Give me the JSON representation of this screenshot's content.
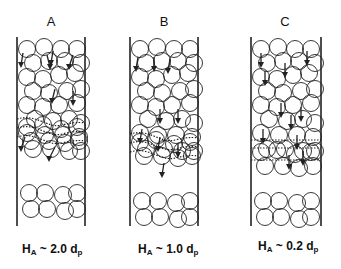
{
  "panels": [
    {
      "label": "A",
      "caption_symbol": "H",
      "caption_sub": "A",
      "caption_value": " ~ 2.0 d",
      "caption_unit_sub": "p",
      "fluidization_zone_thickness_dp": 2.0
    },
    {
      "label": "B",
      "caption_symbol": "H",
      "caption_sub": "A",
      "caption_value": " ~ 1.0 d",
      "caption_unit_sub": "p",
      "fluidization_zone_thickness_dp": 1.0
    },
    {
      "label": "C",
      "caption_symbol": "H",
      "caption_sub": "A",
      "caption_value": " ~ 0.2 d",
      "caption_unit_sub": "p",
      "fluidization_zone_thickness_dp": 0.2
    }
  ],
  "colors": {
    "stroke": "#222222",
    "background": "#ffffff"
  }
}
